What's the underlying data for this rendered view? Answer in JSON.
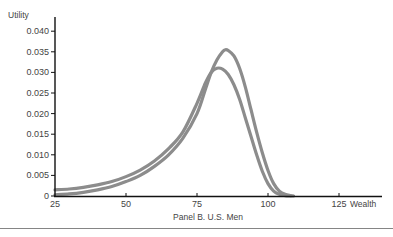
{
  "chart_data": {
    "type": "line",
    "title": "",
    "caption": "Panel B. U.S. Men",
    "xlabel": "Wealth",
    "ylabel": "Utility",
    "xlim": [
      25,
      135
    ],
    "ylim": [
      0,
      0.042
    ],
    "x_ticks": [
      25,
      50,
      75,
      100,
      125
    ],
    "x_tick_labels": [
      "25",
      "50",
      "75",
      "100",
      "125"
    ],
    "y_ticks": [
      0,
      0.005,
      0.01,
      0.015,
      0.02,
      0.025,
      0.03,
      0.035,
      0.04
    ],
    "y_tick_labels": [
      "0",
      "0.005",
      "0.010",
      "0.015",
      "0.020",
      "0.025",
      "0.030",
      "0.035",
      "0.040"
    ],
    "grid": false,
    "legend": null,
    "series": [
      {
        "name": "curve-1 (lower, wider peak)",
        "color": "#8c8c8c",
        "x": [
          25,
          30,
          35,
          40,
          45,
          50,
          55,
          60,
          65,
          70,
          75,
          78,
          80,
          82,
          84,
          86,
          88,
          90,
          92,
          94,
          96,
          98,
          100,
          102,
          104,
          106,
          108
        ],
        "y": [
          0.0015,
          0.0017,
          0.0021,
          0.0027,
          0.0035,
          0.0047,
          0.0063,
          0.0085,
          0.0115,
          0.0155,
          0.0225,
          0.0275,
          0.03,
          0.031,
          0.0308,
          0.0295,
          0.027,
          0.0235,
          0.019,
          0.0145,
          0.01,
          0.006,
          0.003,
          0.0012,
          0.0004,
          0.0001,
          0.0
        ]
      },
      {
        "name": "curve-2 (taller, narrower peak)",
        "color": "#8c8c8c",
        "x": [
          25,
          30,
          35,
          40,
          45,
          50,
          55,
          60,
          65,
          70,
          75,
          78,
          80,
          82,
          84,
          85,
          86,
          88,
          90,
          92,
          94,
          96,
          98,
          100,
          102,
          104,
          106,
          108,
          109
        ],
        "y": [
          0.0003,
          0.0005,
          0.0009,
          0.0015,
          0.0023,
          0.0035,
          0.005,
          0.0072,
          0.01,
          0.014,
          0.02,
          0.026,
          0.03,
          0.033,
          0.035,
          0.0355,
          0.0353,
          0.034,
          0.031,
          0.0265,
          0.021,
          0.0155,
          0.0105,
          0.0062,
          0.003,
          0.0012,
          0.0004,
          0.0001,
          0.0
        ]
      }
    ]
  }
}
